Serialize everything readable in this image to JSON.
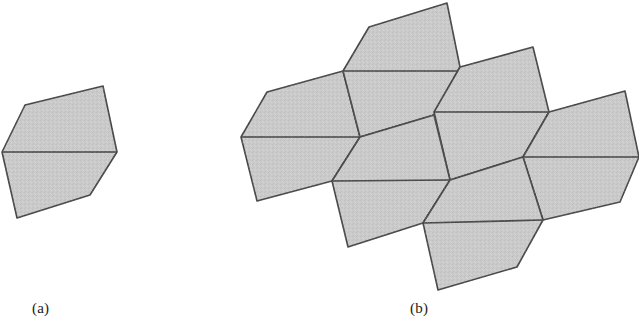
{
  "figure": {
    "background_color": "#ffffff",
    "fill_color": "#cbcbcb",
    "stroke_color": "#333333",
    "stroke_width": 1.6,
    "noise_overlay": true,
    "panels": [
      {
        "id": "panel-a",
        "caption": "(a)",
        "caption_x": 32,
        "caption_y": 300,
        "description": "single pentagon divided by a horizontal chord into two tiles"
      },
      {
        "id": "panel-b",
        "caption": "(b)",
        "caption_x": 410,
        "caption_y": 300,
        "description": "tiling patch of seven congruent pentagons each divided by a horizontal chord"
      }
    ]
  },
  "shapes": {
    "panel_a": {
      "outline": "103,86 25,105 2,152 17,218 90,195 117,152",
      "chord": "2,152 117,152",
      "upper_tile": "103,86 25,105 2,152 117,152",
      "lower_tile": "2,152 17,218 90,195 117,152"
    },
    "panel_b": {
      "tiles": [
        {
          "name": "tile-left",
          "outline": "343,71 267,92 241,137 257,201 332,181 360,137",
          "chord": "241,137 360,137"
        },
        {
          "name": "tile-top-left",
          "outline": "447,3 369,27 343,71 360,137 434,115 460,67",
          "chord": "343,71 458,71"
        },
        {
          "name": "tile-top-right",
          "outline": "533,47 460,67 434,112 450,180 523,157 549,112",
          "chord": "434,112 549,112"
        },
        {
          "name": "tile-right",
          "outline": "625,91 549,112 523,157 543,220 620,202 639,157",
          "chord": "523,157 639,157"
        },
        {
          "name": "tile-center-left",
          "outline": "360,137 332,181 348,247 423,223 450,180 434,115",
          "chord": "332,181 450,180"
        },
        {
          "name": "tile-center-right",
          "outline": "450,180 423,223 438,290 517,267 543,220 523,157",
          "chord": "423,223 543,220"
        },
        {
          "name": "tile-bottom-seam",
          "outline": "",
          "chord": ""
        }
      ]
    }
  }
}
